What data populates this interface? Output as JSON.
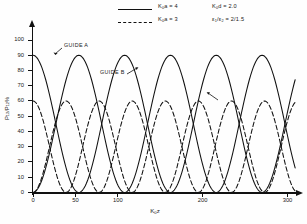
{
  "figure": {
    "legend": {
      "entries": [
        {
          "style": "solid",
          "label_html": "K<sub>0</sub>a = 4",
          "label": "K0a = 4"
        },
        {
          "style": "dashed",
          "label_html": "K<sub>0</sub>a = 3",
          "label": "K0a = 3"
        }
      ]
    },
    "parameters": [
      {
        "label": "K0d = 2.0",
        "label_html": "K<sub>0</sub>d = 2.0"
      },
      {
        "label": "e1/e2 = 2/1.5",
        "label_html": "ε<sub>1</sub>/ε<sub>2</sub> = 2/1.5"
      }
    ],
    "annotations": [
      {
        "name": "guide-a",
        "text": "GUIDE A"
      },
      {
        "name": "guide-b",
        "text": "GUIDE B"
      }
    ]
  },
  "chart_data": {
    "type": "line",
    "title": "",
    "xlabel": "K0z",
    "xlabel_html": "K<sub>0</sub>z",
    "ylabel": "P12 / P12 %",
    "ylabel_html": "P<sub>12</sub>/P<sub>12</sub>%",
    "xlim": [
      0,
      310
    ],
    "ylim": [
      0,
      105
    ],
    "grid": false,
    "legend_position": "top-center",
    "xticks": [
      0,
      50,
      100,
      200,
      300
    ],
    "xtick_labels": [
      "0",
      "50",
      "100",
      "200",
      "300"
    ],
    "yticks": [
      0,
      10,
      20,
      30,
      40,
      50,
      60,
      70,
      80,
      90,
      100
    ],
    "ytick_labels": [
      "0",
      "10",
      "20",
      "30",
      "40",
      "50",
      "60",
      "70",
      "80",
      "90",
      "100"
    ],
    "annotations": [
      {
        "text": "K0d = 2.0",
        "position": "upper-right"
      },
      {
        "text": "e1/e2 = 2/1.5",
        "position": "upper-right"
      }
    ],
    "series": [
      {
        "name": "K0a = 4 (Guide A)",
        "style": "solid",
        "color": "#111111",
        "amplitude": 90,
        "period": 108,
        "phase": "cos2",
        "description": "Power in guide A for K0a=4: starts at 90%, complete oscillation with period ~108",
        "x": [
          0,
          10,
          20,
          30,
          40,
          50,
          60,
          70,
          80,
          90,
          100,
          110,
          120,
          130,
          140,
          150,
          160,
          170,
          180,
          190,
          200,
          210,
          220,
          230,
          240,
          250,
          260,
          270,
          280,
          290,
          300,
          310
        ],
        "y": [
          90,
          83,
          65,
          41,
          18,
          4,
          0,
          6,
          22,
          46,
          70,
          86,
          90,
          84,
          67,
          43,
          20,
          5,
          0,
          5,
          20,
          43,
          67,
          84,
          90,
          86,
          70,
          46,
          22,
          6,
          0,
          4
        ]
      },
      {
        "name": "K0a = 4 (Guide B)",
        "style": "solid",
        "color": "#111111",
        "amplitude": 90,
        "period": 108,
        "phase": "sin2",
        "description": "Complementary solid curve: starts at 0, rises to 90%",
        "x": [
          0,
          10,
          20,
          30,
          40,
          50,
          60,
          70,
          80,
          90,
          100,
          110,
          120,
          130,
          140,
          150,
          160,
          170,
          180,
          190,
          200,
          210,
          220,
          230,
          240,
          250,
          260,
          270,
          280,
          290,
          300,
          310
        ],
        "y": [
          0,
          7,
          25,
          49,
          72,
          86,
          90,
          84,
          68,
          44,
          20,
          4,
          0,
          6,
          23,
          47,
          70,
          85,
          90,
          85,
          70,
          47,
          23,
          6,
          0,
          4,
          20,
          44,
          68,
          84,
          90,
          86
        ]
      },
      {
        "name": "K0a = 3 (Guide A)",
        "style": "dashed",
        "color": "#111111",
        "amplitude": 60,
        "period": 78,
        "phase": "cos2",
        "description": "Power in guide A for K0a=3: starts at 60%, faster oscillation, lower peak",
        "x": [
          0,
          10,
          20,
          30,
          40,
          50,
          60,
          70,
          80,
          90,
          100,
          110,
          120,
          130,
          140,
          150,
          160,
          170,
          180,
          190,
          200,
          210,
          220,
          230,
          240,
          250,
          260,
          270,
          280,
          290,
          300,
          310
        ],
        "y": [
          60,
          53,
          37,
          18,
          4,
          0,
          9,
          28,
          49,
          59,
          56,
          41,
          21,
          6,
          0,
          11,
          31,
          51,
          60,
          55,
          39,
          19,
          4,
          1,
          12,
          33,
          53,
          60,
          54,
          37,
          17,
          3
        ]
      },
      {
        "name": "K0a = 3 (Guide B)",
        "style": "dashed",
        "color": "#111111",
        "amplitude": 60,
        "period": 78,
        "phase": "sin2",
        "description": "Complementary dashed curve: starts at 0, rises to ~60%",
        "x": [
          0,
          10,
          20,
          30,
          40,
          50,
          60,
          70,
          80,
          90,
          100,
          110,
          120,
          130,
          140,
          150,
          160,
          170,
          180,
          190,
          200,
          210,
          220,
          230,
          240,
          250,
          260,
          270,
          280,
          290,
          300,
          310
        ],
        "y": [
          0,
          7,
          23,
          42,
          56,
          60,
          51,
          32,
          11,
          1,
          4,
          19,
          39,
          54,
          60,
          49,
          29,
          9,
          0,
          5,
          21,
          41,
          56,
          59,
          48,
          27,
          7,
          0,
          6,
          23,
          43,
          57
        ]
      }
    ]
  }
}
